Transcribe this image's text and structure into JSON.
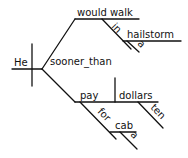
{
  "diagram": {
    "type": "sentence-diagram",
    "subject": "He",
    "conjunction": "sooner_than",
    "upper_predicate": "would walk",
    "upper_preposition": "in",
    "upper_object": "hailstorm",
    "upper_object_modifier": "a",
    "lower_predicate": "pay",
    "lower_object": "dollars",
    "lower_object_modifier": "ten",
    "lower_preposition": "for",
    "lower_prep_object": "cab",
    "lower_prep_object_modifier": "a"
  }
}
